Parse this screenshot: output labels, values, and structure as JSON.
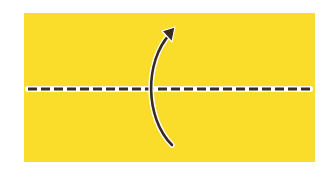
{
  "diagram": {
    "type": "origami-fold-instruction",
    "paper": {
      "color": "#FADC2B",
      "shape": "rectangle",
      "orientation": "landscape"
    },
    "fold_line": {
      "style": "dashed",
      "label": "valley-fold-line",
      "color": "#3a2a22",
      "outline": "#ffffff"
    },
    "arrow": {
      "direction": "bottom-to-top",
      "label": "fold-up-arrow",
      "color": "#3a2a22"
    },
    "instruction": "Fold the bottom half up along the dashed center line"
  }
}
